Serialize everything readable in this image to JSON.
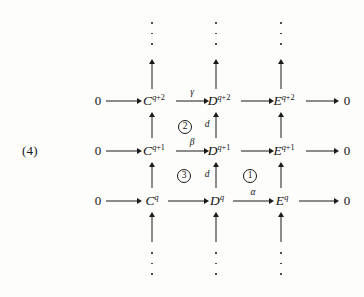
{
  "diagram": {
    "tag": "(4)",
    "type": "commutative-diagram",
    "rows": [
      {
        "id": "row-top",
        "degree": "q+2",
        "left_zero": "0",
        "right_zero": "0",
        "nodes": [
          {
            "base": "C",
            "sup": "q+2"
          },
          {
            "base": "D",
            "sup": "q+2"
          },
          {
            "base": "E",
            "sup": "q+2"
          }
        ],
        "arrow_labels": {
          "zero_to_c": "",
          "c_to_d": "γ",
          "d_to_e": "",
          "e_to_zero": ""
        }
      },
      {
        "id": "row-middle",
        "degree": "q+1",
        "left_zero": "0",
        "right_zero": "0",
        "nodes": [
          {
            "base": "C",
            "sup": "q+1"
          },
          {
            "base": "D",
            "sup": "q+1"
          },
          {
            "base": "E",
            "sup": "q+1"
          }
        ],
        "arrow_labels": {
          "zero_to_c": "",
          "c_to_d": "β",
          "d_to_e": "",
          "e_to_zero": ""
        }
      },
      {
        "id": "row-bottom",
        "degree": "q",
        "left_zero": "0",
        "right_zero": "0",
        "nodes": [
          {
            "base": "C",
            "sup": "q"
          },
          {
            "base": "D",
            "sup": "q"
          },
          {
            "base": "E",
            "sup": "q"
          }
        ],
        "arrow_labels": {
          "zero_to_c": "",
          "c_to_d": "",
          "d_to_e": "α",
          "e_to_zero": ""
        }
      }
    ],
    "vertical_labels": {
      "d_upper": "d",
      "d_lower": "d"
    },
    "regions": [
      {
        "id": "region-1",
        "label": "①",
        "text": "1"
      },
      {
        "id": "region-2",
        "label": "②",
        "text": "2"
      },
      {
        "id": "region-3",
        "label": "③",
        "text": "3"
      }
    ],
    "ellipses": {
      "top": "⋮",
      "bottom": "⋮"
    },
    "colors": {
      "ink": "#1a1a1a",
      "paper": "#fdfdfb"
    }
  }
}
